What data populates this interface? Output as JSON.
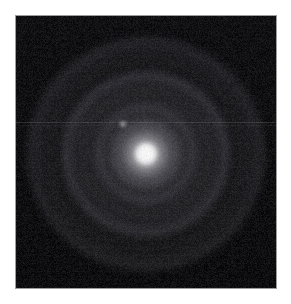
{
  "image": {
    "title": "Stellar diffraction pattern",
    "subject_label": "bright point source with concentric diffraction rings",
    "alt_text": "Dark astronomical frame showing a bright white stellar core surrounded by several faint concentric diffraction rings, with a small faint companion speck up and to the left of the core.",
    "caption": "",
    "background_color": "#ffffff",
    "field_color": "#050506",
    "border_color": "#9d9d9d",
    "core_color": "#ffffff",
    "ring_color": "#92929a",
    "companion_color": "#e2e2e6",
    "scanline_color": "#78787e"
  },
  "frame": {
    "x": 15,
    "y": 15,
    "width": 262,
    "height": 274,
    "border_width": 1
  },
  "features": {
    "core": {
      "name": "stellar-core",
      "center_x": 146,
      "center_y": 154,
      "radius_px": 10,
      "glow_radius_px": 37,
      "peak_brightness": 255
    },
    "companion": {
      "name": "companion-speck",
      "center_x": 123,
      "center_y": 124,
      "radius_px": 4,
      "peak_brightness": 185
    },
    "rings": [
      {
        "name": "ring-1",
        "radius_px": 29,
        "thickness_px": 6,
        "brightness": 42
      },
      {
        "name": "ring-2",
        "radius_px": 43,
        "thickness_px": 7,
        "brightness": 52
      },
      {
        "name": "ring-3",
        "radius_px": 64,
        "thickness_px": 5,
        "brightness": 36
      },
      {
        "name": "ring-4",
        "radius_px": 75,
        "thickness_px": 8,
        "brightness": 64
      },
      {
        "name": "ring-5",
        "radius_px": 98,
        "thickness_px": 6,
        "brightness": 33
      },
      {
        "name": "ring-6",
        "radius_px": 109,
        "thickness_px": 9,
        "brightness": 55
      }
    ],
    "artifacts": [
      {
        "name": "scanline",
        "type": "horizontal-line",
        "y": 122,
        "brightness": 58
      },
      {
        "name": "scanline-secondary",
        "type": "horizontal-line",
        "y": 125,
        "brightness": 40
      }
    ]
  },
  "chart_data": {
    "type": "heatmap",
    "xlabel": "",
    "ylabel": "",
    "grid": false,
    "legend": "none",
    "colormap": "grayscale",
    "value_range": [
      0,
      255
    ],
    "x": [
      0,
      10,
      20,
      29,
      36,
      43,
      52,
      64,
      70,
      75,
      85,
      98,
      104,
      109,
      120,
      131
    ],
    "values": [
      255,
      148,
      46,
      42,
      20,
      52,
      22,
      36,
      24,
      64,
      18,
      33,
      19,
      55,
      12,
      8
    ],
    "annotations": [
      "bright core at center",
      "faint companion speck offset up-left of core",
      "horizontal scan-line artifact across frame"
    ]
  }
}
